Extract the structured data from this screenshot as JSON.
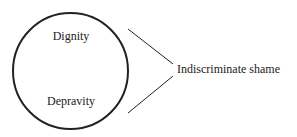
{
  "diagram": {
    "circle_labels": {
      "top": "Dignity",
      "bottom": "Depravity"
    },
    "result_label": "Indiscriminate shame",
    "colors": {
      "stroke": "#222222",
      "text": "#222222",
      "background": "#ffffff"
    }
  }
}
